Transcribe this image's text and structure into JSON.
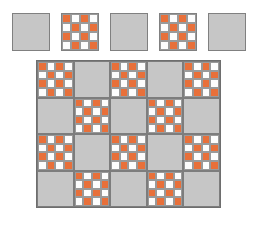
{
  "figure": {
    "background_color": "#ffffff"
  },
  "palette": {
    "accent_orange": "#e8703a",
    "fabric_white": "#fdfdfd",
    "fabric_gray": "#c6c6c6",
    "seam_gray": "#808080"
  },
  "sample_strip": {
    "name": "block-sample-row",
    "x": 12,
    "y": 13,
    "block_size": 38,
    "gap": 11,
    "blocks": [
      {
        "label": "solid-gray-block",
        "type": "solid"
      },
      {
        "label": "checkerboard-block",
        "type": "checker"
      },
      {
        "label": "solid-gray-block",
        "type": "solid"
      },
      {
        "label": "checkerboard-block",
        "type": "checker"
      },
      {
        "label": "solid-gray-block",
        "type": "solid"
      }
    ]
  },
  "checker_block": {
    "rows": 4,
    "cols": 4,
    "start_color": "orange",
    "pattern": [
      [
        "on",
        "off",
        "on",
        "off"
      ],
      [
        "off",
        "on",
        "off",
        "on"
      ],
      [
        "on",
        "off",
        "on",
        "off"
      ],
      [
        "off",
        "on",
        "off",
        "on"
      ]
    ]
  },
  "quilt": {
    "name": "quilt-layout",
    "x": 36,
    "y": 60,
    "cols": 5,
    "rows": 4,
    "block_size": 37,
    "grid": [
      [
        "checker",
        "solid",
        "checker",
        "solid",
        "checker"
      ],
      [
        "solid",
        "checker",
        "solid",
        "checker",
        "solid"
      ],
      [
        "checker",
        "solid",
        "checker",
        "solid",
        "checker"
      ],
      [
        "solid",
        "checker",
        "solid",
        "checker",
        "solid"
      ]
    ]
  }
}
